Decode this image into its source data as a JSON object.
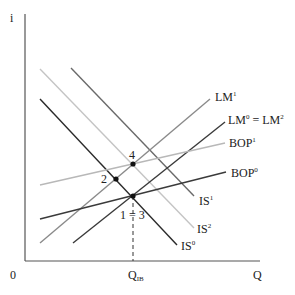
{
  "diagram": {
    "axes": {
      "y_label": "i",
      "x_label": "Q",
      "origin_label": "0",
      "x_marker_label": "Q",
      "x_marker_sub": "IB"
    },
    "curves": {
      "lm1": {
        "base": "LM",
        "sup": "1",
        "color": "#8a8a8a"
      },
      "lm0": {
        "base": "LM",
        "sup": "0",
        "eq": " = LM",
        "sup2": "2",
        "color": "#3a3a3a"
      },
      "bop1": {
        "base": "BOP",
        "sup": "1",
        "color": "#b8b8b8"
      },
      "bop0": {
        "base": "BOP",
        "sup": "0",
        "color": "#3a3a3a"
      },
      "is1": {
        "base": "IS",
        "sup": "1",
        "color": "#6a6a6a"
      },
      "is2": {
        "base": "IS",
        "sup": "2",
        "color": "#c4c4c4"
      },
      "is0": {
        "base": "IS",
        "sup": "0",
        "color": "#2a2a2a"
      }
    },
    "points": {
      "p13": "1 = 3",
      "p2": "2",
      "p4": "4"
    }
  }
}
